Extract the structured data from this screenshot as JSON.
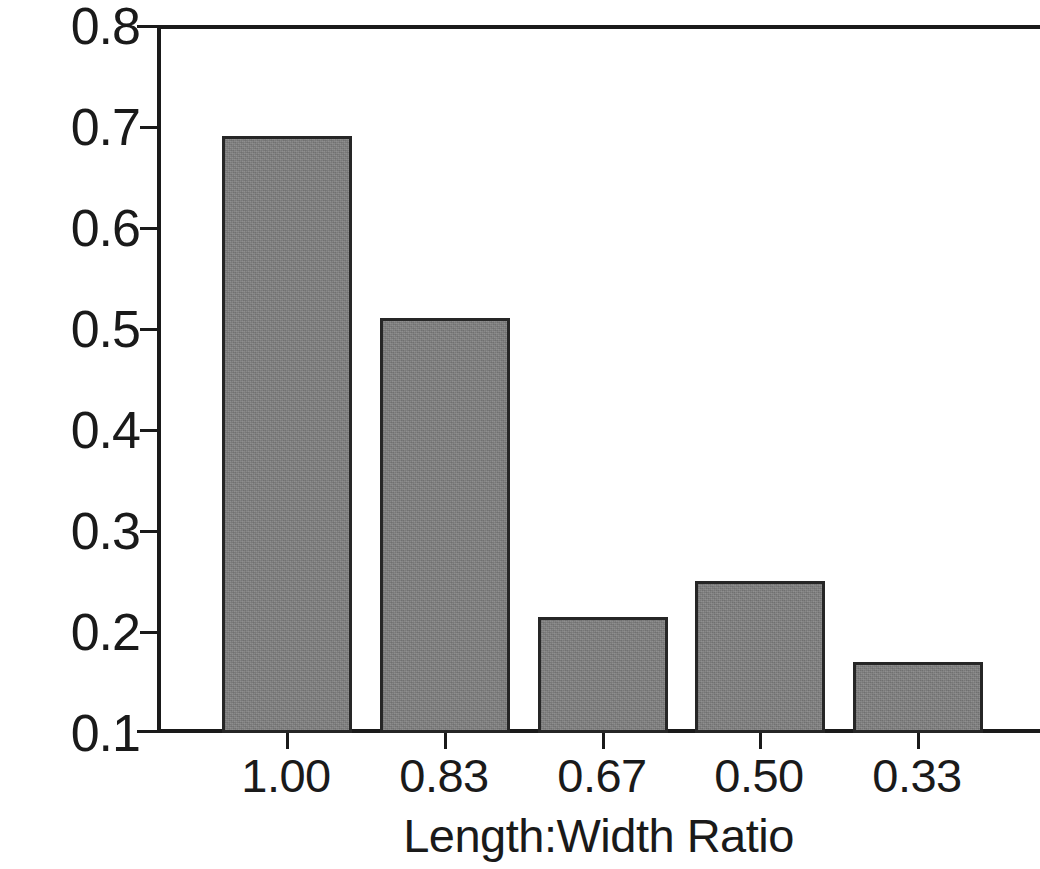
{
  "chart_data": {
    "type": "bar",
    "title": "",
    "xlabel": "Length:Width Ratio",
    "ylabel": "Index of Edge Curvature",
    "categories": [
      "1.00",
      "0.83",
      "0.67",
      "0.50",
      "0.33"
    ],
    "values": [
      0.69,
      0.51,
      0.215,
      0.25,
      0.17
    ],
    "ylim": [
      0.1,
      0.8
    ],
    "yticks": [
      "0.8",
      "0.7",
      "0.6",
      "0.5",
      "0.4",
      "0.3",
      "0.2",
      "0.1"
    ],
    "ytick_values": [
      0.8,
      0.7,
      0.6,
      0.5,
      0.4,
      0.3,
      0.2,
      0.1
    ],
    "grid": false,
    "legend": null,
    "bar_color": "#808080",
    "bar_edge_color": "#262626",
    "axis_color": "#1a1a1a"
  }
}
